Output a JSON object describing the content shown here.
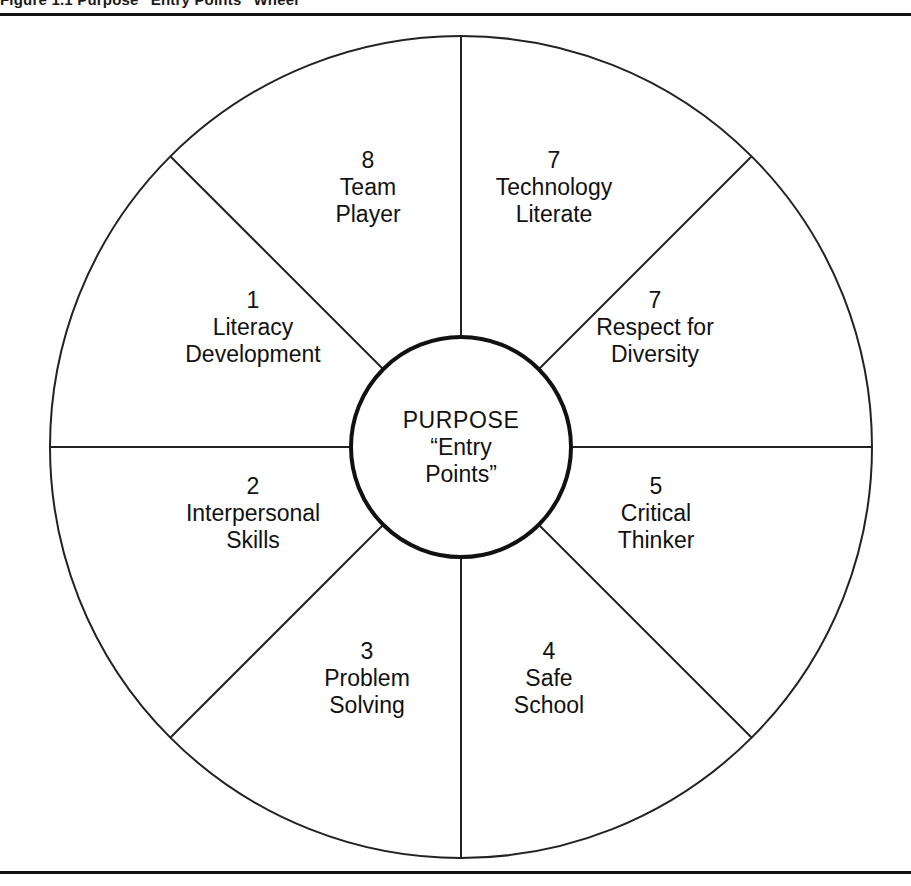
{
  "figure": {
    "caption_sliver": "Figure 1.1  Purpose “Entry Points” Wheel",
    "hub": {
      "title": "PURPOSE",
      "subtitle_line1": "“Entry",
      "subtitle_line2": "Points”"
    },
    "segments": [
      {
        "id": "team-player",
        "number": "8",
        "line1": "Team",
        "line2": "Player",
        "cx": 368,
        "cy": 187
      },
      {
        "id": "technology-literate",
        "number": "7",
        "line1": "Technology",
        "line2": "Literate",
        "cx": 554,
        "cy": 187
      },
      {
        "id": "respect-for-diversity",
        "number": "7",
        "line1": "Respect for",
        "line2": "Diversity",
        "cx": 655,
        "cy": 327
      },
      {
        "id": "critical-thinker",
        "number": "5",
        "line1": "Critical",
        "line2": "Thinker",
        "cx": 656,
        "cy": 513
      },
      {
        "id": "safe-school",
        "number": "4",
        "line1": "Safe",
        "line2": "School",
        "cx": 549,
        "cy": 678
      },
      {
        "id": "problem-solving",
        "number": "3",
        "line1": "Problem",
        "line2": "Solving",
        "cx": 367,
        "cy": 678
      },
      {
        "id": "interpersonal-skills",
        "number": "2",
        "line1": "Interpersonal",
        "line2": "Skills",
        "cx": 253,
        "cy": 513
      },
      {
        "id": "literacy-development",
        "number": "1",
        "line1": "Literacy",
        "line2": "Development",
        "cx": 253,
        "cy": 327
      }
    ],
    "geometry": {
      "center_x": 461,
      "center_y": 447,
      "outer_radius": 411,
      "inner_radius": 110
    },
    "colors": {
      "stroke": "#222222",
      "hub_stroke": "#111111",
      "background": "#ffffff",
      "text": "#111111"
    }
  }
}
